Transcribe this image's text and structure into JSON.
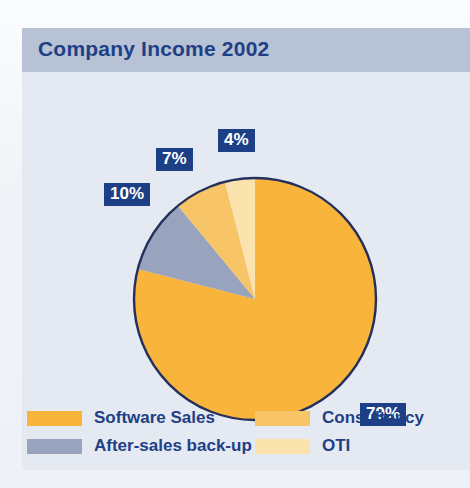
{
  "header": {
    "title": "Company Income 2002"
  },
  "chart_data": {
    "type": "pie",
    "title": "Company Income 2002",
    "categories": [
      "Software Sales",
      "After-sales back-up",
      "Consultancy",
      "OTI"
    ],
    "values": [
      79,
      10,
      7,
      4
    ],
    "value_labels": [
      "79%",
      "10%",
      "7%",
      "4%"
    ],
    "colors": [
      "#f9b43c",
      "#98a3bd",
      "#f7c567",
      "#fbe3ad"
    ],
    "unit": "percent",
    "start_angle": 0,
    "direction": "clockwise",
    "legend_position": "bottom",
    "grid": false,
    "xlabel": "",
    "ylabel": ""
  },
  "badges": {
    "software": "79%",
    "aftersales": "10%",
    "consultancy": "7%",
    "oti": "4%"
  },
  "legend": {
    "items": [
      {
        "label": "Software Sales",
        "color": "#f9b43c"
      },
      {
        "label": "After-sales back-up",
        "color": "#98a3bd"
      },
      {
        "label": "Consultancy",
        "color": "#f7c567"
      },
      {
        "label": "OTI",
        "color": "#fbe3ad"
      }
    ]
  },
  "style": {
    "panel_bg": "#e4e9f2",
    "header_bg": "#b7c2d5",
    "title_color": "#1f3f86",
    "badge_bg": "#1c3f85",
    "badge_text": "#ffffff",
    "pie_outline": "#24305c"
  }
}
